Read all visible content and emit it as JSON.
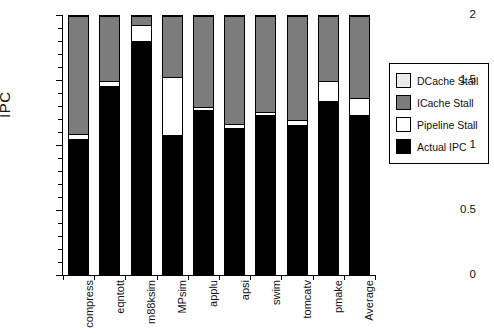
{
  "chart_data": {
    "type": "bar",
    "subtype": "stacked-bar",
    "title": "",
    "xlabel": "",
    "ylabel": "IPC",
    "ylim": [
      0,
      2
    ],
    "yticks": [
      0,
      0.5,
      1,
      1.5,
      2
    ],
    "ytick_labels": [
      "0",
      "0.5",
      "1",
      "1.5",
      "2"
    ],
    "yminor_step": 0.1,
    "grid": false,
    "legend_position": "right",
    "categories": [
      "compress",
      "eqntott",
      "m88ksim",
      "MPsim",
      "applu",
      "apsi",
      "swim",
      "tomcatv",
      "pmake",
      "Average"
    ],
    "series": [
      {
        "name": "Actual IPC",
        "color": "#000000",
        "values": [
          0.885,
          1.26,
          1.44,
          0.723,
          0.846,
          0.615,
          0.92,
          0.75,
          0.94,
          0.9
        ]
      },
      {
        "name": "Pipeline Stall",
        "color": "#ffffff",
        "values": [
          0.185,
          0.22,
          0.38,
          0.377,
          0.444,
          0.535,
          0.33,
          0.43,
          0.42,
          0.35
        ]
      },
      {
        "name": "ICache Stall",
        "color": "#7c7c7c",
        "values": [
          0.03,
          0.03,
          0.12,
          0.44,
          0.02,
          0.03,
          0.02,
          0.03,
          0.15,
          0.13
        ]
      },
      {
        "name": "DCache Stall",
        "color": "#ebebeb",
        "values": [
          0.9,
          0.49,
          0.06,
          0.46,
          0.69,
          0.82,
          0.73,
          0.79,
          0.49,
          0.62
        ]
      }
    ],
    "cumulative_tops": {
      "actual": [
        0.885,
        1.26,
        1.44,
        0.723,
        0.846,
        0.615,
        0.92,
        0.75,
        0.94,
        0.9
      ],
      "pipeline": [
        1.07,
        1.48,
        1.82,
        1.1,
        1.29,
        1.15,
        1.25,
        1.18,
        1.36,
        1.25
      ],
      "icache": [
        1.1,
        1.51,
        1.94,
        1.54,
        1.31,
        1.18,
        1.27,
        1.21,
        1.51,
        1.38
      ],
      "dcache": [
        2.0,
        2.0,
        2.0,
        2.0,
        2.0,
        2.0,
        2.0,
        2.0,
        2.0,
        2.0
      ]
    },
    "legend_entries": [
      {
        "label": "DCache Stall",
        "color": "#ebebeb"
      },
      {
        "label": "ICache Stall",
        "color": "#7c7c7c"
      },
      {
        "label": "Pipeline Stall",
        "color": "#ffffff"
      },
      {
        "label": "Actual IPC",
        "color": "#000000"
      }
    ]
  }
}
